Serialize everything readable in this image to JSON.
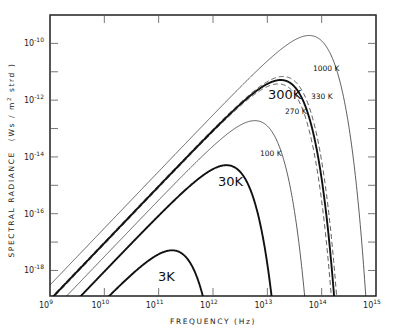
{
  "chart_data": {
    "type": "line",
    "title": "",
    "xlabel": "FREQUENCY (Hz)",
    "ylabel": "SPECTRAL RADIANCE (Ws / m² strd)",
    "xscale": "log",
    "yscale": "log",
    "xlim": [
      1000000000.0,
      1000000000000000.0
    ],
    "ylim": [
      1.26e-19,
      1e-09
    ],
    "grid": false,
    "legend": "inline labels",
    "x_ticks": [
      {
        "base": "10",
        "exp": "9"
      },
      {
        "base": "10",
        "exp": "10"
      },
      {
        "base": "10",
        "exp": "11"
      },
      {
        "base": "10",
        "exp": "12"
      },
      {
        "base": "10",
        "exp": "13"
      },
      {
        "base": "10",
        "exp": "14"
      },
      {
        "base": "10",
        "exp": "15"
      }
    ],
    "y_ticks": [
      {
        "base": "10",
        "exp": "-10"
      },
      {
        "base": "10",
        "exp": "-12"
      },
      {
        "base": "10",
        "exp": "-14"
      },
      {
        "base": "10",
        "exp": "-16"
      },
      {
        "base": "10",
        "exp": "-18"
      }
    ],
    "series": [
      {
        "name": "3K",
        "temperature_K": 3,
        "style": "thick",
        "peak_frequency_hz": 180000000000.0,
        "peak_radiance": 2.7e-19,
        "label_pos": [
          158,
          281
        ],
        "label_size": 13
      },
      {
        "name": "30K",
        "temperature_K": 30,
        "style": "thick",
        "peak_frequency_hz": 1800000000000.0,
        "peak_radiance": 2.7e-16,
        "label_pos": [
          218,
          186
        ],
        "label_size": 13
      },
      {
        "name": "100K",
        "temperature_K": 100,
        "style": "thin",
        "peak_frequency_hz": 5900000000000.0,
        "peak_radiance": 1.9e-14,
        "label_pos": [
          260,
          156
        ],
        "label_size": 7.5
      },
      {
        "name": "270K",
        "temperature_K": 270,
        "style": "dashed",
        "peak_frequency_hz": 16000000000000.0,
        "peak_radiance": 3.7e-12,
        "label_pos": [
          285,
          114
        ],
        "label_size": 7.5
      },
      {
        "name": "300K",
        "temperature_K": 300,
        "style": "thick",
        "peak_frequency_hz": 17600000000000.0,
        "peak_radiance": 5.1e-12,
        "label_pos": [
          268,
          99
        ],
        "label_size": 13
      },
      {
        "name": "330K",
        "temperature_K": 330,
        "style": "dashed",
        "peak_frequency_hz": 19400000000000.0,
        "peak_radiance": 6.8e-12,
        "label_pos": [
          311,
          99
        ],
        "label_size": 7.5
      },
      {
        "name": "1000K",
        "temperature_K": 1000,
        "style": "thin",
        "peak_frequency_hz": 59000000000000.0,
        "peak_radiance": 1.9e-10,
        "label_pos": [
          313,
          71
        ],
        "label_size": 7.5
      }
    ]
  },
  "axis_titles": {
    "x": "FREQUENCY (Hz)",
    "y_main": "SPECTRAL RADIANCE",
    "y_units": "(Ws / m",
    "y_units_sup": "2",
    "y_units_tail": " strd )"
  }
}
